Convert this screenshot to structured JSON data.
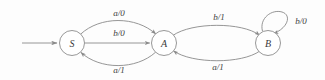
{
  "diagram": {
    "kind": "finite-state-machine",
    "notation": "input/output",
    "background_color": "#fdfdfd",
    "stroke_color": "#8a8a8a",
    "text_color": "#3d3d3d",
    "states": [
      {
        "id": "S",
        "label": "S",
        "cx": 72,
        "cy": 43,
        "r": 12.5,
        "initial": true
      },
      {
        "id": "A",
        "label": "A",
        "cx": 164,
        "cy": 43,
        "r": 12.5,
        "initial": false
      },
      {
        "id": "B",
        "label": "B",
        "cx": 268,
        "cy": 43,
        "r": 12.5,
        "initial": false
      }
    ],
    "entry_arrow": {
      "name": "start-arrow",
      "from_x": 22,
      "to_x": 58,
      "y": 43
    },
    "transitions": [
      {
        "id": "s-a-top",
        "from": "S",
        "to": "A",
        "label": "a/0",
        "input": "a",
        "output": "0",
        "label_x": 119,
        "label_y": 13,
        "shape": "curve-up"
      },
      {
        "id": "s-a-mid",
        "from": "S",
        "to": "A",
        "label": "b/0",
        "input": "b",
        "output": "0",
        "label_x": 119,
        "label_y": 33,
        "shape": "straight"
      },
      {
        "id": "a-s-bottom",
        "from": "A",
        "to": "S",
        "label": "a/1",
        "input": "a",
        "output": "1",
        "label_x": 119,
        "label_y": 70,
        "shape": "curve-down"
      },
      {
        "id": "a-b-top",
        "from": "A",
        "to": "B",
        "label": "b/1",
        "input": "b",
        "output": "1",
        "label_x": 219,
        "label_y": 17,
        "shape": "curve-up"
      },
      {
        "id": "b-a-bottom",
        "from": "B",
        "to": "A",
        "label": "a/1",
        "input": "a",
        "output": "1",
        "label_x": 218,
        "label_y": 67,
        "shape": "curve-down"
      },
      {
        "id": "b-self",
        "from": "B",
        "to": "B",
        "label": "b/0",
        "input": "b",
        "output": "0",
        "label_x": 301,
        "label_y": 21,
        "shape": "self-loop"
      }
    ]
  }
}
